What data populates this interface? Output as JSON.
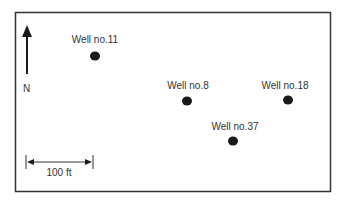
{
  "map": {
    "north_label": "N",
    "scale": {
      "label": "100 ft",
      "length_ft": 100
    },
    "wells": [
      {
        "label": "Well no.11",
        "x": 95,
        "y": 56
      },
      {
        "label": "Well no.8",
        "x": 187,
        "y": 101
      },
      {
        "label": "Well no.18",
        "x": 288,
        "y": 100
      },
      {
        "label": "Well no.37",
        "x": 233,
        "y": 141
      }
    ]
  },
  "colors": {
    "border": "#333333",
    "marker": "#1a1a1a",
    "text": "#333333"
  }
}
